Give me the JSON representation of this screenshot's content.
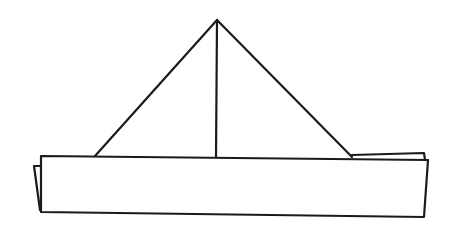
{
  "figure": {
    "description": "Line drawing of a folded paper hat / paper boat",
    "stroke_color": "#1a1a1a",
    "background_color": "#ffffff",
    "shapes": {
      "sail_left_edge": {
        "x1": 217,
        "y1": 20,
        "x2": 95,
        "y2": 156
      },
      "sail_right_edge": {
        "x1": 217,
        "y1": 20,
        "x2": 352,
        "y2": 157
      },
      "mast": {
        "x1": 217,
        "y1": 20,
        "x2": 216,
        "y2": 158
      },
      "hull_points": "41,156 428,160 424,217 41,212",
      "back_flap_left_points": "41,166 34,166 40,210",
      "back_flap_right_points": "352,155 424,153 425,160"
    }
  }
}
